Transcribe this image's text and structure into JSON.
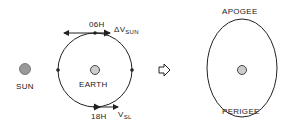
{
  "left_diagram": {
    "sun_label": "SUN",
    "earth_label": "EARTH",
    "top_time_label": "06H",
    "bottom_time_label": "18H",
    "top_vector_prefix": "ΔV",
    "top_vector_subscript": "SUN",
    "bottom_vector_prefix": "V",
    "bottom_vector_subscript": "SL"
  },
  "transition_arrow": "hollow-right-arrow",
  "right_diagram": {
    "apogee_label": "APOGEE",
    "perigee_label": "PERIGEE"
  },
  "colors": {
    "line": "#222222",
    "body_fill": "#bbbbbb",
    "background": "#ffffff"
  }
}
